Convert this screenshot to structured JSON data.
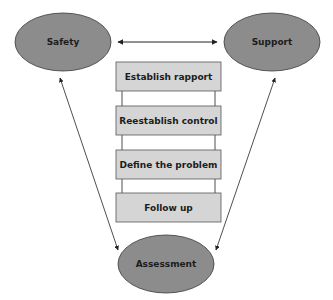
{
  "colors": {
    "ellipse_fill": "#8c8c8c",
    "ellipse_stroke": "#3a3a3a",
    "box_fill": "#d5d5d5",
    "box_stroke": "#555555",
    "line": "#222222"
  },
  "nodes": {
    "safety": {
      "label": "Safety"
    },
    "support": {
      "label": "Support"
    },
    "assessment": {
      "label": "Assessment"
    }
  },
  "steps": [
    {
      "label": "Establish rapport"
    },
    {
      "label": "Reestablish control"
    },
    {
      "label": "Define the problem"
    },
    {
      "label": "Follow up"
    }
  ]
}
